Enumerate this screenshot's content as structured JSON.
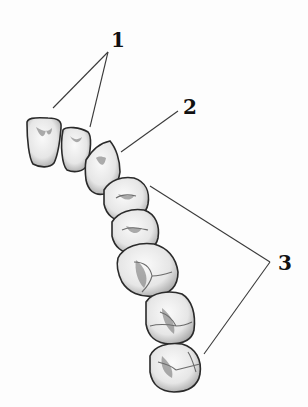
{
  "diagram": {
    "type": "dental-arch-illustration",
    "labels": [
      {
        "id": "1",
        "text": "1",
        "points_to": [
          "central-incisor",
          "lateral-incisor"
        ]
      },
      {
        "id": "2",
        "text": "2",
        "points_to": [
          "canine"
        ]
      },
      {
        "id": "3",
        "text": "3",
        "points_to": [
          "first-premolar",
          "third-molar"
        ]
      }
    ],
    "teeth": [
      "central-incisor",
      "lateral-incisor",
      "canine",
      "first-premolar",
      "second-premolar",
      "first-molar",
      "second-molar",
      "third-molar"
    ],
    "colors": {
      "background": "#fdfdfd",
      "outline": "#2a2a2a",
      "leader": "#3a3a3a",
      "label": "#111111"
    }
  }
}
